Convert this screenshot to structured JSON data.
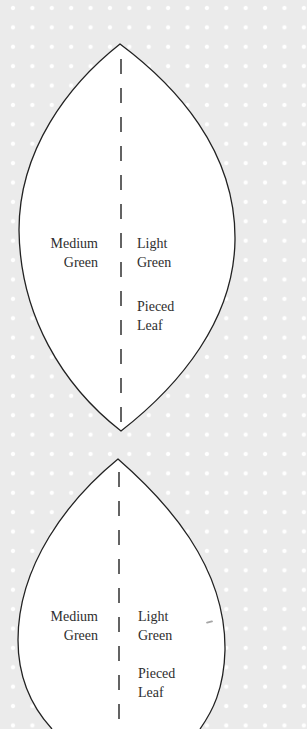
{
  "page": {
    "background_color": "#ebebeb",
    "dot_color": "#ffffff",
    "outline_color": "#222222",
    "text_color": "#2e2e2e"
  },
  "leaves": [
    {
      "left_label": [
        "Medium",
        "Green"
      ],
      "right_label": [
        "Light",
        "Green"
      ],
      "piece_label": [
        "Pieced",
        "Leaf"
      ]
    },
    {
      "left_label": [
        "Medium",
        "Green"
      ],
      "right_label": [
        "Light",
        "Green"
      ],
      "piece_label": [
        "Pieced",
        "Leaf"
      ]
    }
  ]
}
